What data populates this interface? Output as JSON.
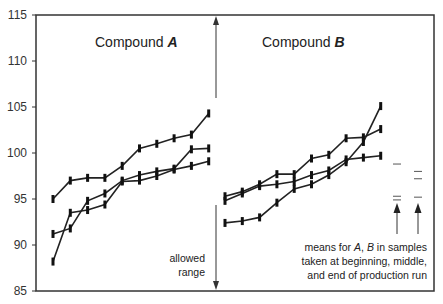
{
  "chart_data": {
    "type": "line",
    "title": "",
    "ylabel": "",
    "xlabel": "",
    "ylim": [
      85,
      115
    ],
    "yticks": [
      85,
      90,
      95,
      100,
      105,
      110,
      115
    ],
    "grid": false,
    "panels": [
      {
        "title": "Compound",
        "title_italic": "A",
        "series": [
          {
            "name": "A-run-1",
            "values": [
              95.0,
              97.0,
              97.3,
              97.3,
              98.6,
              100.5,
              101.0,
              101.6,
              102.0,
              104.3
            ]
          },
          {
            "name": "A-run-2",
            "values": [
              91.2,
              91.8,
              94.8,
              95.6,
              97.0,
              97.6,
              98.0,
              98.3,
              100.4,
              100.5
            ]
          },
          {
            "name": "A-run-3",
            "values": [
              88.2,
              93.5,
              93.8,
              94.4,
              96.9,
              97.0,
              97.5,
              98.2,
              98.6,
              99.1
            ]
          }
        ]
      },
      {
        "title": "Compound",
        "title_italic": "B",
        "series": [
          {
            "name": "B-run-1",
            "values": [
              95.3,
              95.8,
              96.6,
              97.7,
              97.7,
              99.4,
              99.8,
              101.6,
              101.7,
              102.6
            ]
          },
          {
            "name": "B-run-2",
            "values": [
              94.8,
              95.6,
              96.4,
              96.6,
              96.9,
              97.6,
              98.1,
              99.3,
              99.5,
              99.7
            ]
          },
          {
            "name": "B-run-3",
            "values": [
              92.4,
              92.6,
              93.0,
              94.6,
              96.1,
              96.6,
              97.6,
              99.0,
              101.2,
              105.1
            ]
          }
        ]
      }
    ],
    "means": {
      "A": [
        98.8,
        95.3,
        94.9
      ],
      "B": [
        98.0,
        97.2,
        95.2
      ]
    },
    "annotations": {
      "allowed_range": [
        "allowed",
        "range"
      ],
      "means_note": [
        "means for A, B in samples",
        "taken at beginning, middle,",
        "and end of production run"
      ]
    }
  },
  "labels": {
    "panel_a_title": "Compound ",
    "panel_a_letter": "A",
    "panel_b_title": "Compound ",
    "panel_b_letter": "B",
    "allowed_line1": "allowed",
    "allowed_line2": "range",
    "note_line1_pre": "means for ",
    "note_line1_a": "A",
    "note_line1_mid": ", ",
    "note_line1_b": "B",
    "note_line1_post": " in samples",
    "note_line2": "taken at beginning, middle,",
    "note_line3": "and end of production run"
  }
}
